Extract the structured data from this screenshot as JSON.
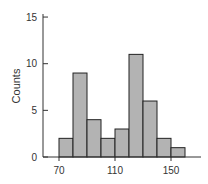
{
  "chart_data": {
    "type": "bar",
    "title": "",
    "xlabel": "",
    "ylabel": "Counts",
    "bin_edges": [
      70,
      80,
      90,
      100,
      110,
      120,
      130,
      140,
      150,
      160
    ],
    "categories": [
      "70-80",
      "80-90",
      "90-100",
      "100-110",
      "110-120",
      "120-130",
      "130-140",
      "140-150",
      "150-160"
    ],
    "values": [
      2,
      9,
      4,
      2,
      3,
      11,
      6,
      2,
      1
    ],
    "xlim": [
      60,
      170
    ],
    "ylim": [
      0,
      15
    ],
    "x_ticks": [
      70,
      110,
      150
    ],
    "y_ticks": [
      0,
      5,
      10,
      15
    ],
    "grid": false,
    "legend": null
  },
  "colors": {
    "bar_fill": "#b3b3b3",
    "bar_stroke": "#222222",
    "axis": "#333333"
  },
  "labels": {
    "ylabel": "Counts",
    "x_ticks": [
      "70",
      "110",
      "150"
    ],
    "y_ticks": [
      "0",
      "5",
      "10",
      "15"
    ]
  }
}
